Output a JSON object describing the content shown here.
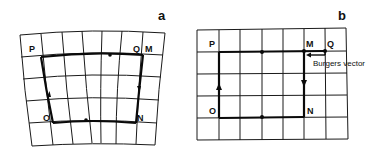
{
  "panels": [
    {
      "id": "a",
      "label": "a",
      "description": "Burgers circuit around an edge dislocation in a distorted crystal lattice",
      "points": {
        "P": "P",
        "Q": "Q",
        "M": "M",
        "O": "O",
        "N": "N"
      }
    },
    {
      "id": "b",
      "label": "b",
      "description": "Same circuit mapped onto a perfect reference lattice; closure failure is the Burgers vector",
      "points": {
        "P": "P",
        "M": "M",
        "Q": "Q",
        "O": "O",
        "N": "N"
      },
      "annotation": "Burgers vector"
    }
  ],
  "colors": {
    "ink": "#111111",
    "background": "#ffffff"
  }
}
